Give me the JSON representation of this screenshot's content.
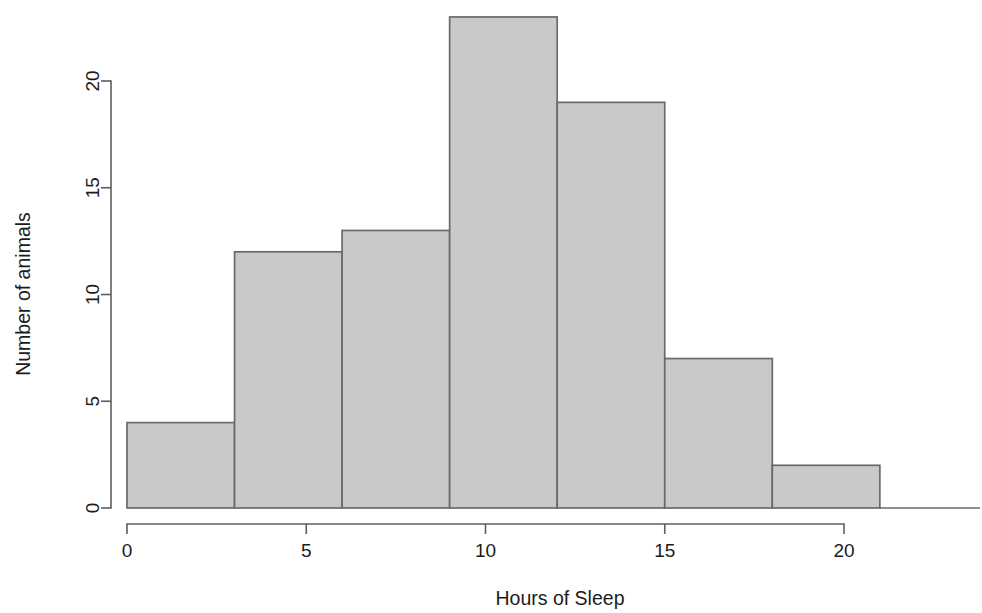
{
  "chart_data": {
    "type": "bar",
    "title": "",
    "subtitle": "",
    "xlabel": "Hours of Sleep",
    "ylabel": "Number of animals",
    "categories": [
      "0-3",
      "3-6",
      "6-9",
      "9-12",
      "12-15",
      "15-18",
      "18-21"
    ],
    "bin_edges": [
      0,
      3,
      6,
      9,
      12,
      15,
      18,
      21
    ],
    "bin_width": 3,
    "values": [
      4,
      12,
      13,
      23,
      19,
      7,
      2
    ],
    "x": [
      1.5,
      4.5,
      7.5,
      10.5,
      13.5,
      16.5,
      19.5
    ],
    "xlim": [
      0,
      21
    ],
    "ylim": [
      0,
      23
    ],
    "x_ticks": [
      0,
      5,
      10,
      15,
      20
    ],
    "x_tick_labels": [
      "0",
      "5",
      "10",
      "15",
      "20"
    ],
    "y_ticks": [
      0,
      5,
      10,
      15,
      20
    ],
    "y_tick_labels": [
      "0",
      "5",
      "10",
      "15",
      "20"
    ],
    "grid": false,
    "legend": false,
    "legend_position": "none",
    "bar_fill_color": "#c9c9c9",
    "bar_border_color": "#6a6a6a",
    "axis_color": "#5e5e5e",
    "text_color": "#1c1c1c",
    "background_color": "#ffffff",
    "annotations": []
  },
  "axes": {
    "x_title": "Hours of Sleep",
    "y_title": "Number of animals"
  }
}
